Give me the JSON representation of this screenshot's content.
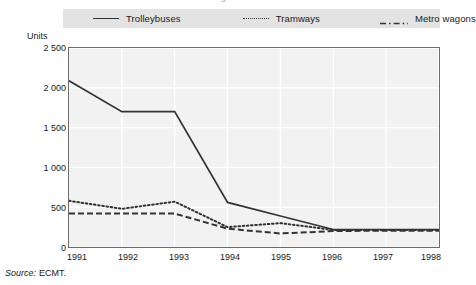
{
  "title_sliver": "Figure",
  "legend": {
    "position": "top",
    "items": [
      {
        "label": "Trolleybuses",
        "style": "solid",
        "swatch": "solid-line-swatch"
      },
      {
        "label": "Tramways",
        "style": "dotted",
        "swatch": "dotted-line-swatch"
      },
      {
        "label": "Metro wagons",
        "style": "dashdot",
        "swatch": "dash-dot-line-swatch"
      }
    ],
    "background_color": "#e3e3e3"
  },
  "axis": {
    "units_label": "Units",
    "y_ticks": [
      "2 500",
      "2 000",
      "1 500",
      "1 000",
      "500",
      "0"
    ],
    "x_ticks": [
      "1991",
      "1992",
      "1993",
      "1994",
      "1995",
      "1996",
      "1997",
      "1998"
    ]
  },
  "source": {
    "label": "Source:",
    "value": "ECMT."
  },
  "colors": {
    "line": "#333333",
    "plot_background": "#f2f2f2",
    "plot_border": "#6d6d6d",
    "gridline": "#ffffff",
    "legend_background": "#e3e3e3"
  },
  "chart_data": {
    "type": "line",
    "title": "",
    "xlabel": "",
    "ylabel": "Units",
    "x": [
      1991,
      1992,
      1993,
      1994,
      1995,
      1996,
      1997,
      1998
    ],
    "categories": [
      "1991",
      "1992",
      "1993",
      "1994",
      "1995",
      "1996",
      "1997",
      "1998"
    ],
    "ylim": [
      0,
      2500
    ],
    "xlim": [
      1991,
      1998
    ],
    "y_ticks": [
      0,
      500,
      1000,
      1500,
      2000,
      2500
    ],
    "grid": true,
    "legend_position": "top",
    "series": [
      {
        "name": "Trolleybuses",
        "style": "solid",
        "values": [
          2090,
          1700,
          1700,
          560,
          390,
          220,
          220,
          220
        ]
      },
      {
        "name": "Tramways",
        "style": "dotted",
        "values": [
          580,
          480,
          570,
          250,
          300,
          215,
          215,
          215
        ]
      },
      {
        "name": "Metro wagons",
        "style": "dashdot",
        "values": [
          420,
          420,
          420,
          230,
          170,
          200,
          205,
          205
        ]
      }
    ]
  }
}
